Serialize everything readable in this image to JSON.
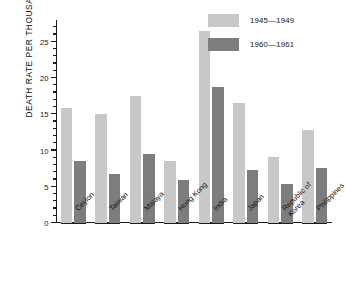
{
  "chart_data": {
    "type": "bar",
    "title": "",
    "xlabel": "",
    "ylabel": "DEATH RATE PER THOUSAND",
    "ylim": [
      0,
      28
    ],
    "ytick_labels": [
      "0",
      "5",
      "10",
      "15",
      "20",
      "25"
    ],
    "ytick_values": [
      0,
      5,
      10,
      15,
      20,
      25
    ],
    "minor_tick_step": 1,
    "grid": false,
    "legend_position": "top-right",
    "categories": [
      "Ceylon",
      "Taiwan",
      "Malaya",
      "Hong Kong",
      "India",
      "Japan",
      "Republic of\nKorea",
      "Philippines"
    ],
    "series": [
      {
        "name": "1945—1949",
        "color": "#c8c8c8",
        "values": [
          15.9,
          15.1,
          17.5,
          8.5,
          26.5,
          16.5,
          9.1,
          12.8
        ]
      },
      {
        "name": "1960—1961",
        "color": "#7d7d7d",
        "values": [
          8.5,
          6.8,
          9.5,
          6.0,
          18.7,
          7.3,
          5.4,
          7.6
        ]
      }
    ]
  },
  "legend": {
    "items": [
      {
        "label": "1945—1949",
        "color": "#c8c8c8"
      },
      {
        "label": "1960—1961",
        "color": "#7d7d7d"
      }
    ]
  },
  "colors": {
    "axis": "#1c1c1c",
    "text": "#141414",
    "background": "#ffffff",
    "series_light": "#c8c8c8",
    "series_dark": "#7d7d7d"
  }
}
